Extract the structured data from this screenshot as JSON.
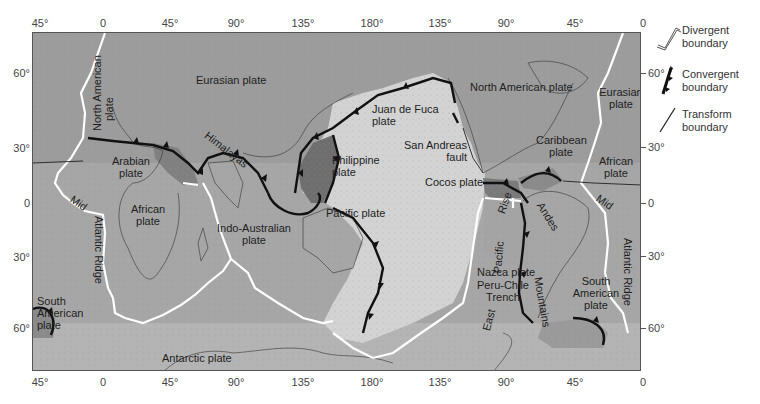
{
  "figure": {
    "colors": {
      "background": "#ffffff",
      "continental_plate": "#9a9a9a",
      "pacific_plate": "#d2d2d2",
      "small_plate_dark": "#6e6e6e",
      "divergent_boundary": "#ffffff",
      "convergent_boundary": "#111111",
      "frame": "#555555"
    }
  },
  "axes": {
    "top_longitudes": [
      "45°",
      "0",
      "45°",
      "90°",
      "135°",
      "180°",
      "135°",
      "90°",
      "45°",
      "0"
    ],
    "bottom_longitudes": [
      "45°",
      "0",
      "45°",
      "90°",
      "135°",
      "180°",
      "135°",
      "90°",
      "45°",
      "0"
    ],
    "left_latitudes": [
      "60°",
      "30°",
      "0",
      "30°",
      "60°"
    ],
    "right_latitudes": [
      "60°",
      "30°",
      "0",
      "30°",
      "60°"
    ]
  },
  "legend": {
    "divergent": {
      "line1": "Divergent",
      "line2": "boundary",
      "icon": "divergent-boundary-icon"
    },
    "convergent": {
      "line1": "Convergent",
      "line2": "boundary",
      "icon": "convergent-boundary-icon"
    },
    "transform": {
      "line1": "Transform",
      "line2": "boundary",
      "icon": "transform-boundary-icon"
    }
  },
  "labels": {
    "north_american_left_1": "North American",
    "north_american_left_2": "plate",
    "eurasian": "Eurasian plate",
    "arabian_1": "Arabian",
    "arabian_2": "plate",
    "himalayas": "Himalayas",
    "philippine_1": "Philippine",
    "philippine_2": "plate",
    "juan_de_fuca_1": "Juan de Fuca",
    "juan_de_fuca_2": "plate",
    "san_andreas_1": "San Andreas",
    "san_andreas_2": "fault",
    "north_american_right": "North American plate",
    "eurasian_right_1": "Eurasian",
    "eurasian_right_2": "plate",
    "caribbean_1": "Caribbean",
    "caribbean_2": "plate",
    "african_right_1": "African",
    "african_right_2": "plate",
    "cocos": "Cocos plate",
    "african_left_1": "African",
    "african_left_2": "plate",
    "mid_left": "Mid",
    "atlantic_ridge_left": "Atlantic Ridge",
    "indo_australian_1": "Indo-Australian",
    "indo_australian_2": "plate",
    "pacific": "Pacific plate",
    "rise": "Rise",
    "pacific_rot": "Pacific",
    "east": "East",
    "nazca": "Nazca plate",
    "peru_chile_1": "Peru-Chile",
    "peru_chile_2": "Trench",
    "andes": "Andes",
    "mountains": "Mountains",
    "south_american_right_1": "South",
    "south_american_right_2": "American",
    "south_american_right_3": "plate",
    "mid_right": "Mid",
    "atlantic_ridge_right": "Atlantic Ridge",
    "south_american_left_1": "South",
    "south_american_left_2": "American",
    "south_american_left_3": "plate",
    "antarctic_left": "Antarctic plate",
    "antarctic_right": "Antarctic plate",
    "scotia_left_1": "Scotia",
    "scotia_left_2": "plate",
    "scotia_right_1": "Scotia",
    "scotia_right_2": "plate"
  }
}
